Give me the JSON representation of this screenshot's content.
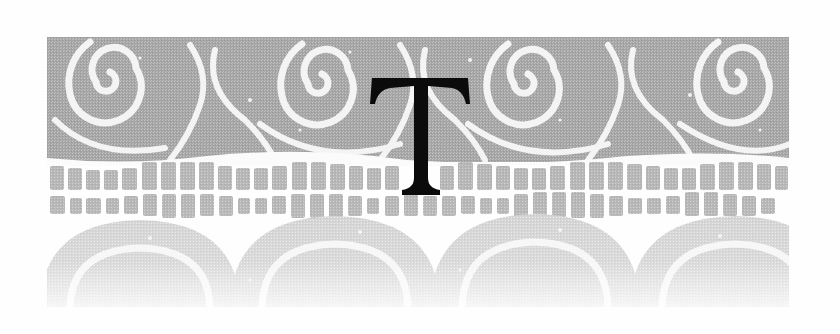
{
  "ornament": {
    "letter": "T",
    "letter_color": "#0b0b0b",
    "pattern_color_dark": "#a9a9a9",
    "pattern_color_mid": "#bdbdbd",
    "pattern_color_light": "#d6d6d6",
    "background_color": "#fefefe",
    "motifs": [
      "spiral-band",
      "tile-rows",
      "scalloped-arcs"
    ],
    "spiral_count": 4
  }
}
